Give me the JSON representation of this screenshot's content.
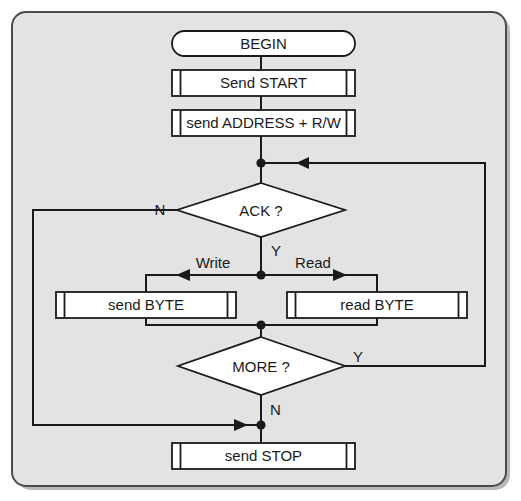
{
  "diagram": {
    "background_color": "#e3e3e3",
    "page_color": "#ffffff",
    "line_color": "#1a1a1a",
    "shape_fill": "#ffffff",
    "nodes": {
      "begin": {
        "label": "BEGIN",
        "shape": "terminator"
      },
      "send_start": {
        "label": "Send START",
        "shape": "predefined-process"
      },
      "send_address": {
        "label": "send ADDRESS + R/W",
        "shape": "predefined-process"
      },
      "ack": {
        "label": "ACK ?",
        "shape": "decision"
      },
      "send_byte": {
        "label": "send BYTE",
        "shape": "predefined-process"
      },
      "read_byte": {
        "label": "read BYTE",
        "shape": "predefined-process"
      },
      "more": {
        "label": "MORE ?",
        "shape": "decision"
      },
      "send_stop": {
        "label": "send STOP",
        "shape": "predefined-process"
      }
    },
    "edge_labels": {
      "ack_no": "N",
      "ack_yes": "Y",
      "write": "Write",
      "read": "Read",
      "more_yes": "Y",
      "more_no": "N"
    }
  }
}
